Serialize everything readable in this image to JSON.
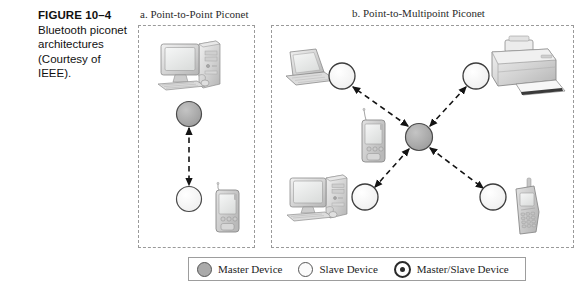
{
  "caption": {
    "figure_number": "FIGURE 10–4",
    "text": "Bluetooth piconet architectures (Courtesy of IEEE)."
  },
  "panels": [
    {
      "id": "a",
      "title": "a. Point-to-Point Piconet"
    },
    {
      "id": "b",
      "title": "b. Point-to-Multipoint Piconet"
    }
  ],
  "legend": {
    "items": [
      {
        "icon": "filled-gray-circle-icon",
        "label": "Master Device"
      },
      {
        "icon": "open-white-circle-icon",
        "label": "Slave Device"
      },
      {
        "icon": "ringed-circle-icon",
        "label": "Master/Slave Device"
      }
    ]
  },
  "diagram": {
    "type": "network-topology",
    "panel_a": {
      "topology": "point-to-point",
      "nodes": [
        {
          "name": "desktop-computer",
          "role": "device",
          "x": 182,
          "y": 72
        },
        {
          "name": "master-node",
          "role": "master",
          "x": 189,
          "y": 114
        },
        {
          "name": "slave-node",
          "role": "slave",
          "x": 189,
          "y": 199
        },
        {
          "name": "pda-device",
          "role": "device",
          "x": 228,
          "y": 208
        }
      ],
      "links": [
        {
          "from": "master-node",
          "to": "slave-node",
          "style": "dashed",
          "arrows": "both"
        }
      ]
    },
    "panel_b": {
      "topology": "point-to-multipoint-star",
      "nodes": [
        {
          "name": "master-node",
          "role": "master",
          "x": 419,
          "y": 137
        },
        {
          "name": "slave-node-top-left",
          "role": "slave",
          "x": 342,
          "y": 76
        },
        {
          "name": "slave-node-top-right",
          "role": "slave",
          "x": 476,
          "y": 76
        },
        {
          "name": "slave-node-bottom-left",
          "role": "slave",
          "x": 365,
          "y": 197
        },
        {
          "name": "slave-node-bottom-right",
          "role": "slave",
          "x": 493,
          "y": 197
        },
        {
          "name": "laptop-computer",
          "role": "device",
          "x": 305,
          "y": 70
        },
        {
          "name": "printer",
          "role": "device",
          "x": 519,
          "y": 73
        },
        {
          "name": "desktop-computer",
          "role": "device",
          "x": 311,
          "y": 205
        },
        {
          "name": "cell-phone",
          "role": "device",
          "x": 525,
          "y": 205
        },
        {
          "name": "pda-device",
          "role": "device",
          "x": 374,
          "y": 141
        }
      ],
      "links": [
        {
          "from": "master-node",
          "to": "slave-node-top-left",
          "style": "dashed",
          "arrows": "both"
        },
        {
          "from": "master-node",
          "to": "slave-node-top-right",
          "style": "dashed",
          "arrows": "both"
        },
        {
          "from": "master-node",
          "to": "slave-node-bottom-left",
          "style": "dashed",
          "arrows": "both"
        },
        {
          "from": "master-node",
          "to": "slave-node-bottom-right",
          "style": "dashed",
          "arrows": "both"
        }
      ]
    },
    "colors": {
      "master_fill": "#a9a9a9",
      "slave_fill": "#fbfbfb",
      "node_stroke": "#4a4a4a",
      "link_stroke": "#1f1f1f",
      "panel_border": "#9a9a9a",
      "device_body": "#d5d5d5",
      "device_screen": "#eceded"
    }
  }
}
